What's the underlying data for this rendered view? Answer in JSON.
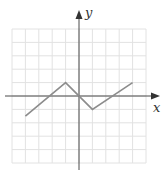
{
  "chart_data": {
    "type": "line",
    "title": "",
    "xlabel": "x",
    "ylabel": "y",
    "xlim": [
      -5,
      5
    ],
    "ylim": [
      -5,
      5
    ],
    "grid": true,
    "legend": null,
    "series": [
      {
        "name": "f",
        "x": [
          -4,
          -1,
          1,
          4
        ],
        "y": [
          -1.5,
          1,
          -1,
          1
        ]
      }
    ]
  },
  "colors": {
    "axis": "#4a4a4a",
    "grid": "#e2e2e2",
    "line": "#8c8c8c"
  },
  "labels": {
    "x_axis": "x",
    "y_axis": "y"
  }
}
